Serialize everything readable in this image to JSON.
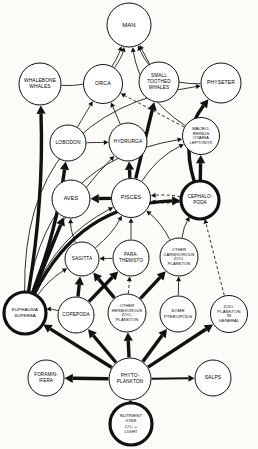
{
  "diagram": {
    "type": "food-web-diagram",
    "colors": {
      "background": "#fcfbf8",
      "ink": "#111111",
      "node_fill": "#ffffff"
    },
    "nodes": [
      {
        "id": "man",
        "label": "MAN",
        "lines": [
          "MAN"
        ],
        "cx": 129,
        "cy": 25,
        "r": 22,
        "font": 6.0,
        "emphasis": false
      },
      {
        "id": "whalebone",
        "label": "WHALEBONE WHALES",
        "lines": [
          "WHALEBONE",
          "WHALES"
        ],
        "cx": 40,
        "cy": 84,
        "r": 21,
        "font": 4.9,
        "emphasis": false
      },
      {
        "id": "orca",
        "label": "ORCA",
        "lines": [
          "ORCA"
        ],
        "cx": 103,
        "cy": 84,
        "r": 19.5,
        "font": 5.4,
        "emphasis": false
      },
      {
        "id": "smalltooth",
        "label": "SMALL TOOTHED WHALES",
        "lines": [
          "SMALL",
          "TOOTHED",
          "WHALES"
        ],
        "cx": 159,
        "cy": 82,
        "r": 20,
        "font": 4.7,
        "emphasis": false
      },
      {
        "id": "physeter",
        "label": "PHYSETER",
        "lines": [
          "PHYSETER"
        ],
        "cx": 221,
        "cy": 83,
        "r": 20,
        "font": 5.0,
        "emphasis": false
      },
      {
        "id": "lobodon",
        "label": "LOBODON",
        "lines": [
          "LOBODON"
        ],
        "cx": 68,
        "cy": 143,
        "r": 18,
        "font": 4.9,
        "emphasis": false
      },
      {
        "id": "hydrurga",
        "label": "HYDRURGA",
        "lines": [
          "HYDRURGA"
        ],
        "cx": 128,
        "cy": 142,
        "r": 19,
        "font": 4.9,
        "emphasis": false
      },
      {
        "id": "macro",
        "label": "MACRO-RHINUS OTARIA LEPTONYX",
        "lines": [
          "MACRO-",
          "RHINUS",
          "OTARIA",
          "LEPTONYX"
        ],
        "cx": 201,
        "cy": 136,
        "r": 18.5,
        "font": 4.2,
        "emphasis": false
      },
      {
        "id": "aves",
        "label": "AVES",
        "lines": [
          "AVES"
        ],
        "cx": 71,
        "cy": 199,
        "r": 19,
        "font": 5.4,
        "emphasis": false
      },
      {
        "id": "pisces",
        "label": "PISCES",
        "lines": [
          "PISCES"
        ],
        "cx": 131,
        "cy": 198,
        "r": 19.5,
        "font": 5.4,
        "emphasis": false
      },
      {
        "id": "cephalo",
        "label": "CEPHALOPODA",
        "lines": [
          "CEPHALO-",
          "PODA"
        ],
        "cx": 200,
        "cy": 200,
        "r": 19,
        "font": 4.7,
        "emphasis": true
      },
      {
        "id": "sagitta",
        "label": "SAGITTA",
        "lines": [
          "SAGITTA"
        ],
        "cx": 82,
        "cy": 259,
        "r": 17,
        "font": 4.7,
        "emphasis": false
      },
      {
        "id": "parathem",
        "label": "PARATHEMISTO",
        "lines": [
          "PARA-",
          "THEMISTO"
        ],
        "cx": 131,
        "cy": 258,
        "r": 18,
        "font": 4.5,
        "emphasis": false
      },
      {
        "id": "othercarn",
        "label": "OTHER CARNIVOROUS ZOOPLANKTON",
        "lines": [
          "OTHER",
          "CARNIVOROUS",
          "ZOO-",
          "PLANKTON"
        ],
        "cx": 179,
        "cy": 257,
        "r": 19,
        "font": 4.0,
        "emphasis": false
      },
      {
        "id": "euphausia",
        "label": "EUPHAUSIA SUPERBA",
        "lines": [
          "EUPHAUSIA",
          "SUPERBA"
        ],
        "cx": 25,
        "cy": 313,
        "r": 21,
        "font": 4.4,
        "emphasis": true
      },
      {
        "id": "copepoda",
        "label": "COPEPODA",
        "lines": [
          "COPEPODA"
        ],
        "cx": 76,
        "cy": 315,
        "r": 18,
        "font": 4.7,
        "emphasis": false
      },
      {
        "id": "otherherb",
        "label": "OTHER HERBIVOROUS ZOOPLANKTON",
        "lines": [
          "OTHER",
          "HERBIVOROUS",
          "ZOO-",
          "PLANKTON"
        ],
        "cx": 127,
        "cy": 313,
        "r": 19,
        "font": 4.0,
        "emphasis": false
      },
      {
        "id": "pteropods",
        "label": "SOME PTEROPODS",
        "lines": [
          "SOME",
          "PTEROPODS"
        ],
        "cx": 178,
        "cy": 314,
        "r": 18,
        "font": 4.4,
        "emphasis": false
      },
      {
        "id": "zoogeneral",
        "label": "ZOOPLANKTON IN GENERAL",
        "lines": [
          "ZOO-",
          "PLANKTON",
          "IN",
          "GENERAL"
        ],
        "cx": 229,
        "cy": 314,
        "r": 18.5,
        "font": 4.2,
        "emphasis": false
      },
      {
        "id": "foram",
        "label": "FORAMINIFERA",
        "lines": [
          "FORAMIN-",
          "IFERA"
        ],
        "cx": 46,
        "cy": 378,
        "r": 18,
        "font": 4.6,
        "emphasis": false
      },
      {
        "id": "phyto",
        "label": "PHYTOPLANKTON",
        "lines": [
          "PHYTO-",
          "PLANKTON"
        ],
        "cx": 130,
        "cy": 379,
        "r": 21,
        "font": 4.8,
        "emphasis": false
      },
      {
        "id": "salps",
        "label": "SALPS",
        "lines": [
          "SALPS"
        ],
        "cx": 213,
        "cy": 378,
        "r": 18,
        "font": 5.0,
        "emphasis": false
      },
      {
        "id": "nutrient",
        "label": "NUTRIENT IONS CO2 + LIGHT",
        "lines": [
          "NUTRIENT",
          "IONS",
          "CO₂ +",
          "LIGHT"
        ],
        "cx": 131,
        "cy": 424,
        "r": 21,
        "font": 4.3,
        "emphasis": true
      }
    ],
    "edges": [
      {
        "from": "whalebone",
        "to": "man",
        "weight": "thin",
        "style": "solid",
        "curve": 0.38
      },
      {
        "from": "smalltooth",
        "to": "man",
        "weight": "thin",
        "style": "solid",
        "curve": 0.0
      },
      {
        "from": "physeter",
        "to": "man",
        "weight": "thin",
        "style": "solid",
        "curve": -0.34
      },
      {
        "from": "orca",
        "to": "man",
        "weight": "thin",
        "style": "solid",
        "curve": 0.1
      },
      {
        "from": "macro",
        "to": "man",
        "weight": "thin",
        "style": "solid",
        "curve": -0.22
      },
      {
        "from": "lobodon",
        "to": "orca",
        "weight": "thin",
        "style": "solid",
        "curve": 0.0
      },
      {
        "from": "lobodon",
        "to": "hydrurga",
        "weight": "thin",
        "style": "solid",
        "curve": 0.0
      },
      {
        "from": "hydrurga",
        "to": "orca",
        "weight": "thin",
        "style": "solid",
        "curve": 0.0
      },
      {
        "from": "macro",
        "to": "orca",
        "weight": "thin",
        "style": "dashed",
        "curve": 0.0
      },
      {
        "from": "euphausia",
        "to": "whalebone",
        "weight": "thick",
        "style": "solid",
        "curve": 0.05
      },
      {
        "from": "euphausia",
        "to": "lobodon",
        "weight": "thick",
        "style": "solid",
        "curve": 0.06
      },
      {
        "from": "euphausia",
        "to": "aves",
        "weight": "thick",
        "style": "solid",
        "curve": 0.0
      },
      {
        "from": "euphausia",
        "to": "pisces",
        "weight": "thin",
        "style": "solid",
        "curve": -0.18
      },
      {
        "from": "euphausia",
        "to": "sagitta",
        "weight": "thin",
        "style": "solid",
        "curve": -0.1
      },
      {
        "from": "euphausia",
        "to": "cephalo",
        "weight": "thick",
        "style": "solid",
        "curve": -0.3
      },
      {
        "from": "euphausia",
        "to": "physeter",
        "weight": "thin",
        "style": "solid",
        "curve": -0.44
      },
      {
        "from": "euphausia",
        "to": "hydrurga",
        "weight": "thin",
        "style": "solid",
        "curve": -0.12
      },
      {
        "from": "euphausia",
        "to": "macro",
        "weight": "thin",
        "style": "solid",
        "curve": -0.36
      },
      {
        "from": "pisces",
        "to": "aves",
        "weight": "thick",
        "style": "solid",
        "curve": 0.0
      },
      {
        "from": "pisces",
        "to": "hydrurga",
        "weight": "thick",
        "style": "solid",
        "curve": 0.0
      },
      {
        "from": "pisces",
        "to": "macro",
        "weight": "thin",
        "style": "solid",
        "curve": -0.14
      },
      {
        "from": "pisces",
        "to": "smalltooth",
        "weight": "thick",
        "style": "solid",
        "curve": 0.0
      },
      {
        "from": "cephalo",
        "to": "pisces",
        "weight": "thin",
        "style": "dashed",
        "curve": 0.07
      },
      {
        "from": "cephalo",
        "to": "pisces",
        "weight": "thin",
        "style": "dashed",
        "curve": -0.07
      },
      {
        "from": "cephalo",
        "to": "macro",
        "weight": "thick",
        "style": "solid",
        "curve": 0.0
      },
      {
        "from": "cephalo",
        "to": "physeter",
        "weight": "thick",
        "style": "solid",
        "curve": -0.26
      },
      {
        "from": "sagitta",
        "to": "pisces",
        "weight": "thin",
        "style": "solid",
        "curve": 0.1
      },
      {
        "from": "sagitta",
        "to": "aves",
        "weight": "thin",
        "style": "solid",
        "curve": -0.1
      },
      {
        "from": "parathem",
        "to": "pisces",
        "weight": "thin",
        "style": "solid",
        "curve": 0.0
      },
      {
        "from": "parathem",
        "to": "sagitta",
        "weight": "thin",
        "style": "solid",
        "curve": 0.0
      },
      {
        "from": "othercarn",
        "to": "cephalo",
        "weight": "thin",
        "style": "solid",
        "curve": -0.1
      },
      {
        "from": "othercarn",
        "to": "pisces",
        "weight": "thin",
        "style": "solid",
        "curve": 0.1
      },
      {
        "from": "copepoda",
        "to": "euphausia",
        "weight": "thin",
        "style": "solid",
        "curve": 0.1
      },
      {
        "from": "copepoda",
        "to": "sagitta",
        "weight": "thick",
        "style": "solid",
        "curve": 0.0
      },
      {
        "from": "copepoda",
        "to": "parathem",
        "weight": "thick",
        "style": "solid",
        "curve": 0.0
      },
      {
        "from": "otherherb",
        "to": "parathem",
        "weight": "thin",
        "style": "dashed",
        "curve": 0.0
      },
      {
        "from": "otherherb",
        "to": "sagitta",
        "weight": "thick",
        "style": "solid",
        "curve": 0.0
      },
      {
        "from": "otherherb",
        "to": "othercarn",
        "weight": "thick",
        "style": "solid",
        "curve": 0.0
      },
      {
        "from": "pteropods",
        "to": "othercarn",
        "weight": "thin",
        "style": "solid",
        "curve": 0.0
      },
      {
        "from": "zoogeneral",
        "to": "cephalo",
        "weight": "thin",
        "style": "dashed",
        "curve": 0.0
      },
      {
        "from": "phyto",
        "to": "foram",
        "weight": "thick",
        "style": "solid",
        "curve": 0.0
      },
      {
        "from": "phyto",
        "to": "salps",
        "weight": "medium",
        "style": "solid",
        "curve": 0.0
      },
      {
        "from": "phyto",
        "to": "euphausia",
        "weight": "thick",
        "style": "solid",
        "curve": 0.0
      },
      {
        "from": "phyto",
        "to": "copepoda",
        "weight": "thick",
        "style": "solid",
        "curve": 0.0
      },
      {
        "from": "phyto",
        "to": "otherherb",
        "weight": "thick",
        "style": "solid",
        "curve": 0.0
      },
      {
        "from": "phyto",
        "to": "pteropods",
        "weight": "thick",
        "style": "solid",
        "curve": 0.0
      },
      {
        "from": "phyto",
        "to": "zoogeneral",
        "weight": "thick",
        "style": "solid",
        "curve": 0.0
      },
      {
        "from": "nutrient",
        "to": "phyto",
        "weight": "thick",
        "style": "solid",
        "curve": 0.0
      }
    ]
  }
}
